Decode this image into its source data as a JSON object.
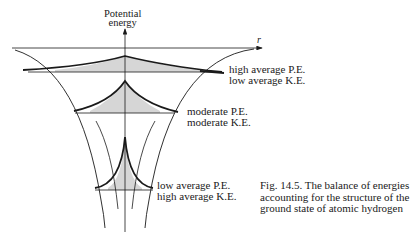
{
  "axes": {
    "y_label_line1": "Potential",
    "y_label_line2": "energy",
    "x_label": "r"
  },
  "levels": [
    {
      "name": "high-pe-level",
      "line1": "high average P.E.",
      "line2": "low average K.E."
    },
    {
      "name": "moderate-level",
      "line1": "moderate P.E.",
      "line2": "moderate K.E."
    },
    {
      "name": "low-pe-level",
      "line1": "low average P.E.",
      "line2": "high average K.E."
    }
  ],
  "caption": "Fig. 14.5.  The balance of energies accounting for the structure of the ground state of atomic hydrogen",
  "colors": {
    "line": "#1a1a1a",
    "fill": "#d6d6d6"
  }
}
